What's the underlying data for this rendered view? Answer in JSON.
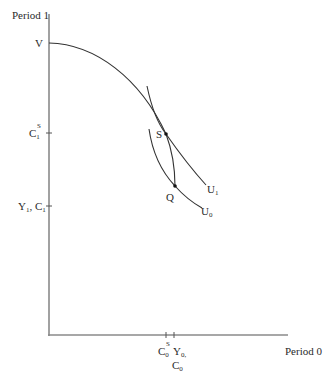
{
  "diagram": {
    "type": "intertemporal-consumption-diagram",
    "axes": {
      "y_label": "Period 1",
      "x_label": "Period 0"
    },
    "y_axis_labels": {
      "v": "V",
      "c1s_main": "C",
      "c1s_sub": "1",
      "c1s_sup": "S",
      "y1_main": "Y",
      "y1_sub": "1",
      "y1_sep": ", ",
      "c1_main": "C",
      "c1_sub": "1"
    },
    "x_axis_labels": {
      "c0s_main": "C",
      "c0s_sub": "0",
      "c0s_sup": "S",
      "y0_main": "Y",
      "y0_sub": "0,",
      "c0_main": "C",
      "c0_sub": "0"
    },
    "points": {
      "s": "S",
      "q": "Q"
    },
    "curves": {
      "u1_main": "U",
      "u1_sub": "1",
      "u0_main": "U",
      "u0_sub": "0"
    },
    "colors": {
      "axis": "#8a8a8a",
      "curve": "#333333",
      "text": "#2a2a2a"
    }
  }
}
